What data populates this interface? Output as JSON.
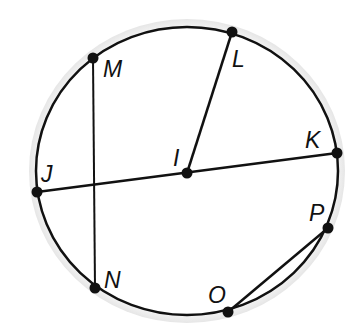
{
  "diagram": {
    "type": "circle-geometry",
    "center_label": "I",
    "points": [
      {
        "id": "M",
        "label": "M"
      },
      {
        "id": "L",
        "label": "L"
      },
      {
        "id": "K",
        "label": "K"
      },
      {
        "id": "J",
        "label": "J"
      },
      {
        "id": "I",
        "label": "I"
      },
      {
        "id": "P",
        "label": "P"
      },
      {
        "id": "O",
        "label": "O"
      },
      {
        "id": "N",
        "label": "N"
      }
    ],
    "segments": [
      {
        "name": "chord-MN",
        "from": "M",
        "to": "N",
        "kind": "chord"
      },
      {
        "name": "diameter-JK",
        "from": "J",
        "to": "K",
        "kind": "diameter"
      },
      {
        "name": "radius-IL",
        "from": "I",
        "to": "L",
        "kind": "radius"
      },
      {
        "name": "chord-OP",
        "from": "O",
        "to": "P",
        "kind": "chord"
      }
    ],
    "colors": {
      "stroke": "#111111",
      "background": "#ffffff"
    }
  }
}
